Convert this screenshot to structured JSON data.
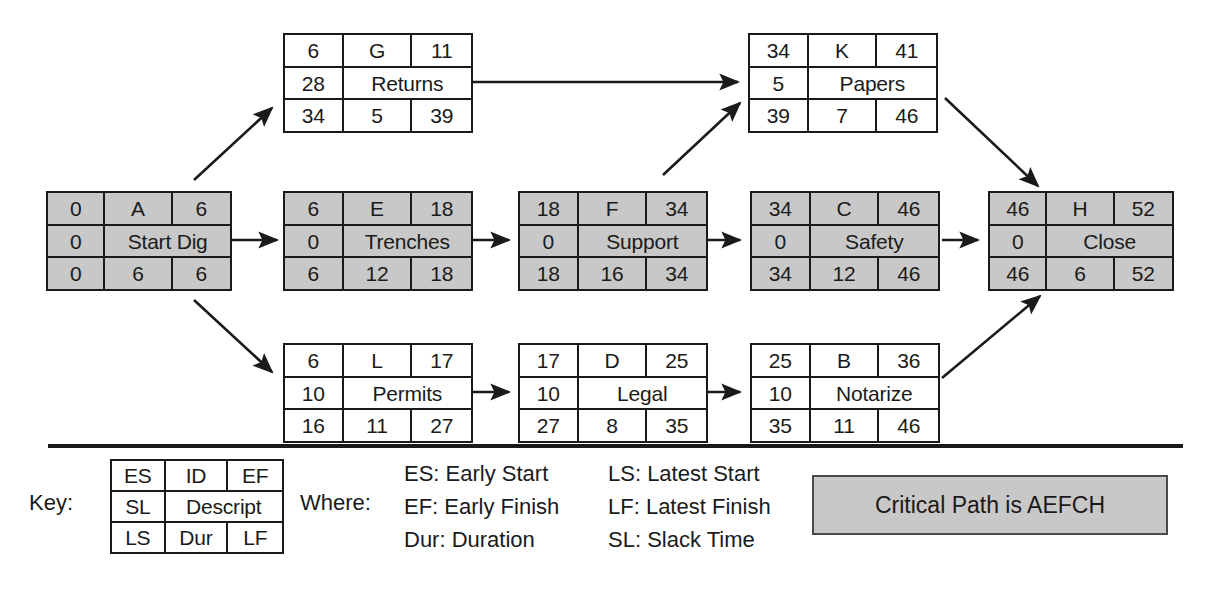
{
  "diagram": {
    "title_text": "",
    "critical_color": "#c8c8c8",
    "normal_color": "#ffffff",
    "line_color": "#1a1a1a",
    "nodes": [
      {
        "key": "A",
        "es": "0",
        "id": "A",
        "ef": "6",
        "sl": "0",
        "descript": "Start Dig",
        "ls": "0",
        "dur": "6",
        "lf": "6",
        "critical": true
      },
      {
        "key": "G",
        "es": "6",
        "id": "G",
        "ef": "11",
        "sl": "28",
        "descript": "Returns",
        "ls": "34",
        "dur": "5",
        "lf": "39",
        "critical": false
      },
      {
        "key": "K",
        "es": "34",
        "id": "K",
        "ef": "41",
        "sl": "5",
        "descript": "Papers",
        "ls": "39",
        "dur": "7",
        "lf": "46",
        "critical": false
      },
      {
        "key": "E",
        "es": "6",
        "id": "E",
        "ef": "18",
        "sl": "0",
        "descript": "Trenches",
        "ls": "6",
        "dur": "12",
        "lf": "18",
        "critical": true
      },
      {
        "key": "F",
        "es": "18",
        "id": "F",
        "ef": "34",
        "sl": "0",
        "descript": "Support",
        "ls": "18",
        "dur": "16",
        "lf": "34",
        "critical": true
      },
      {
        "key": "C",
        "es": "34",
        "id": "C",
        "ef": "46",
        "sl": "0",
        "descript": "Safety",
        "ls": "34",
        "dur": "12",
        "lf": "46",
        "critical": true
      },
      {
        "key": "H",
        "es": "46",
        "id": "H",
        "ef": "52",
        "sl": "0",
        "descript": "Close",
        "ls": "46",
        "dur": "6",
        "lf": "52",
        "critical": true
      },
      {
        "key": "L",
        "es": "6",
        "id": "L",
        "ef": "17",
        "sl": "10",
        "descript": "Permits",
        "ls": "16",
        "dur": "11",
        "lf": "27",
        "critical": false
      },
      {
        "key": "D",
        "es": "17",
        "id": "D",
        "ef": "25",
        "sl": "10",
        "descript": "Legal",
        "ls": "27",
        "dur": "8",
        "lf": "35",
        "critical": false
      },
      {
        "key": "B",
        "es": "25",
        "id": "B",
        "ef": "36",
        "sl": "10",
        "descript": "Notarize",
        "ls": "35",
        "dur": "11",
        "lf": "46",
        "critical": false
      }
    ],
    "edges": [
      {
        "from": "A",
        "to": "G"
      },
      {
        "from": "A",
        "to": "E"
      },
      {
        "from": "A",
        "to": "L"
      },
      {
        "from": "G",
        "to": "K"
      },
      {
        "from": "E",
        "to": "F"
      },
      {
        "from": "F",
        "to": "C"
      },
      {
        "from": "F",
        "to": "K"
      },
      {
        "from": "C",
        "to": "H"
      },
      {
        "from": "K",
        "to": "H"
      },
      {
        "from": "L",
        "to": "D"
      },
      {
        "from": "D",
        "to": "B"
      },
      {
        "from": "B",
        "to": "H"
      }
    ]
  },
  "legend": {
    "key_label": "Key:",
    "where_label": "Where:",
    "key_node": {
      "es": "ES",
      "id": "ID",
      "ef": "EF",
      "sl": "SL",
      "descript": "Descript",
      "ls": "LS",
      "dur": "Dur",
      "lf": "LF"
    },
    "where_column_1": [
      "ES: Early Start",
      "EF: Early Finish",
      "Dur: Duration"
    ],
    "where_column_2": [
      "LS: Latest Start",
      "LF: Latest Finish",
      "SL: Slack Time"
    ],
    "critical_path_text": "Critical Path is AEFCH"
  }
}
